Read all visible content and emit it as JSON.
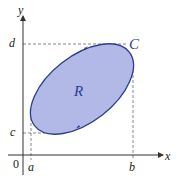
{
  "diagram": {
    "axis_x_label": "x",
    "axis_y_label": "y",
    "origin_label": "0",
    "a_label": "a",
    "b_label": "b",
    "c_label": "c",
    "d_label": "d",
    "curve_label": "C",
    "region_label": "R",
    "colors": {
      "fill": "#b3b9e6",
      "stroke": "#2b3f8f",
      "axis": "#333333",
      "dash": "#555555"
    }
  }
}
